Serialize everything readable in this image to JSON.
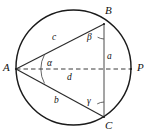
{
  "figure": {
    "stroke_color": "#1a1a1a",
    "dash_color": "#3a3a3a",
    "background_color": "#ffffff",
    "circle": {
      "cx": 73.5,
      "cy": 67.5,
      "r": 57.5
    },
    "points": {
      "A": {
        "x": 16.0,
        "y": 69.0
      },
      "B": {
        "x": 104.0,
        "y": 24.0
      },
      "C": {
        "x": 104.0,
        "y": 117.0
      },
      "P": {
        "x": 131.0,
        "y": 69.0
      }
    },
    "vertex_labels": [
      {
        "name": "A",
        "text": "A",
        "x": 3,
        "y": 62
      },
      {
        "name": "B",
        "text": "B",
        "x": 105,
        "y": 5
      },
      {
        "name": "C",
        "text": "C",
        "x": 105,
        "y": 120
      },
      {
        "name": "P",
        "text": "P",
        "x": 137,
        "y": 62
      }
    ],
    "side_labels": [
      {
        "name": "c",
        "text": "c",
        "x": 52,
        "y": 33
      },
      {
        "name": "a",
        "text": "a",
        "x": 107,
        "y": 52
      },
      {
        "name": "d",
        "text": "d",
        "x": 67,
        "y": 73
      },
      {
        "name": "b",
        "text": "b",
        "x": 54,
        "y": 96
      }
    ],
    "angle_labels": [
      {
        "name": "alpha",
        "text": "α",
        "x": 47,
        "y": 59
      },
      {
        "name": "beta",
        "text": "β",
        "x": 87,
        "y": 33
      },
      {
        "name": "gamma",
        "text": "γ",
        "x": 87,
        "y": 97
      }
    ],
    "segments": [
      {
        "name": "segment-AB",
        "from": "A",
        "to": "B",
        "style": "solid",
        "label": "c"
      },
      {
        "name": "segment-AC",
        "from": "A",
        "to": "C",
        "style": "solid",
        "label": "b"
      },
      {
        "name": "segment-BC",
        "from": "B",
        "to": "C",
        "style": "solid",
        "label": "a"
      },
      {
        "name": "segment-AP",
        "from": "A",
        "to": "P",
        "style": "dashed",
        "label": "d"
      }
    ],
    "angle_arcs": [
      {
        "name": "arc-alpha-at-A",
        "vertex": "A",
        "between": [
          "c",
          "b"
        ]
      },
      {
        "name": "arc-beta-at-B",
        "vertex": "B",
        "between": [
          "c",
          "a"
        ]
      },
      {
        "name": "arc-gamma-at-C",
        "vertex": "C",
        "between": [
          "b",
          "a"
        ]
      }
    ]
  }
}
